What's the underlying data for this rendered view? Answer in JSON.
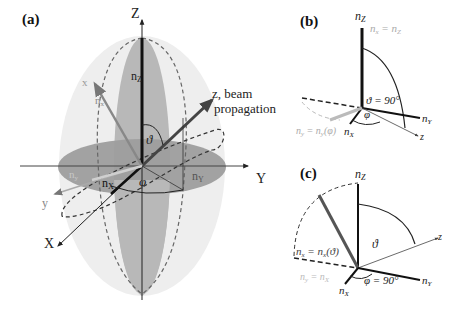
{
  "panels": {
    "a": {
      "label": "(a)",
      "axes": {
        "Z": "Z",
        "Y": "Y",
        "X": "X"
      },
      "beam_axes": {
        "x": "x",
        "y": "y",
        "z_line1": "z, beam",
        "z_line2": "propagation"
      },
      "indices": {
        "nZ": "n",
        "nZ_sub": "Z",
        "nY": "n",
        "nY_sub": "Y",
        "nX": "n",
        "nX_sub": "X",
        "nx": "n",
        "nx_sub": "x",
        "ny": "n",
        "ny_sub": "y"
      },
      "angles": {
        "theta": "ϑ",
        "phi": "φ"
      }
    },
    "b": {
      "label": "(b)",
      "nZ": "n",
      "nZ_sub": "Z",
      "nY": "n",
      "nY_sub": "Y",
      "nX": "n",
      "nX_sub": "X",
      "z": "z",
      "eq_top": "nₓ = n_Z",
      "eq_top_display": "n",
      "eq_top_sub1": "x",
      "eq_top_mid": " = n",
      "eq_top_sub2": "Z",
      "theta_eq": "ϑ = 90°",
      "phi": "φ",
      "eq_bottom_a": "n",
      "eq_bottom_sub1": "y",
      "eq_bottom_b": " = n",
      "eq_bottom_sub2": "y",
      "eq_bottom_c": "(φ)"
    },
    "c": {
      "label": "(c)",
      "nZ": "n",
      "nZ_sub": "Z",
      "nY": "n",
      "nY_sub": "Y",
      "nX": "n",
      "nX_sub": "X",
      "z": "z",
      "theta": "ϑ",
      "phi_eq": "φ = 90°",
      "eq_x_a": "n",
      "eq_x_sub1": "x",
      "eq_x_b": " = n",
      "eq_x_sub2": "x",
      "eq_x_c": "(ϑ)",
      "eq_y_a": "n",
      "eq_y_sub1": "y",
      "eq_y_b": " = n",
      "eq_y_sub2": "X"
    }
  },
  "colors": {
    "ellipsoid_fill": "#ececec",
    "ellipse_dark": "#9a9a9a",
    "ellipse_mid": "#b5b5b5",
    "axis": "#222222",
    "dashed": "#555555",
    "light_text": "#aaaaaa"
  }
}
